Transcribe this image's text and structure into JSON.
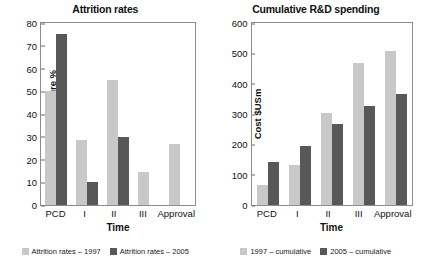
{
  "chart_data": [
    {
      "type": "bar",
      "title": "Attrition rates",
      "xlabel": "Time",
      "ylabel": "Chance of failure %",
      "categories": [
        "PCD",
        "I",
        "II",
        "III",
        "Approval"
      ],
      "ylim": [
        0,
        80
      ],
      "yticks": [
        0,
        10,
        20,
        30,
        40,
        50,
        60,
        70,
        80
      ],
      "grid": false,
      "legend_position": "bottom",
      "series": [
        {
          "name": "Attrition rates – 1997",
          "color": "#c8c8c8",
          "values": [
            50,
            28.5,
            55,
            14.5,
            27
          ]
        },
        {
          "name": "Attrition rates – 2005",
          "color": "#585858",
          "values": [
            75,
            10,
            30,
            null,
            null
          ]
        }
      ]
    },
    {
      "type": "bar",
      "title": "Cumulative R&D spending",
      "xlabel": "Time",
      "ylabel": "Cost $USm",
      "categories": [
        "PCD",
        "I",
        "II",
        "III",
        "Approval"
      ],
      "ylim": [
        0,
        600
      ],
      "yticks": [
        0,
        100,
        200,
        300,
        400,
        500,
        600
      ],
      "grid": false,
      "legend_position": "bottom",
      "series": [
        {
          "name": "1997 – cumulative",
          "color": "#c8c8c8",
          "values": [
            67,
            133,
            302,
            467,
            507
          ]
        },
        {
          "name": "2005 – cumulative",
          "color": "#585858",
          "values": [
            142,
            194,
            267,
            326,
            367
          ]
        }
      ]
    }
  ]
}
